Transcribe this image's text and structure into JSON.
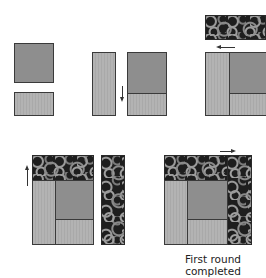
{
  "diagram": {
    "steps": [
      {
        "id": 1,
        "description": "Center square and light rectangle shown separately"
      },
      {
        "id": 2,
        "description": "Light vertical strip beside joined square and rectangle, arrow pointing down"
      },
      {
        "id": 3,
        "description": "Print horizontal strip above assembled unit, arrow pointing left"
      },
      {
        "id": 4,
        "description": "Print band added on top, print vertical strip alongside, arrow pointing up"
      },
      {
        "id": 5,
        "description": "Print vertical strip added to right, arrow pointing right"
      }
    ],
    "arrows": {
      "step2": "down",
      "step3": "left",
      "step4": "up",
      "step5": "right"
    },
    "colors": {
      "dark_fabric": "#8e8e8e",
      "light_fabric": "#b0b0b0",
      "print_fabric": "#1e1e1e",
      "outline": "#3a3a3a"
    }
  },
  "caption": {
    "line1": "First round",
    "line2": "completed"
  }
}
